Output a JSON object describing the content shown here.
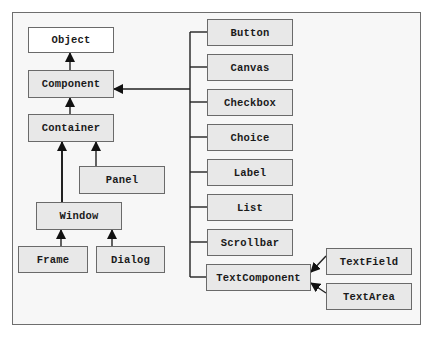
{
  "diagram": {
    "type": "class-hierarchy",
    "colors": {
      "node_fill": "#e8e8e8",
      "root_fill": "#ffffff",
      "border": "#6a6a6a",
      "edge": "#1a1a1a",
      "background": "#f7f7f7"
    },
    "nodes": {
      "object": "Object",
      "component": "Component",
      "container": "Container",
      "panel": "Panel",
      "window": "Window",
      "frame": "Frame",
      "dialog": "Dialog",
      "button": "Button",
      "canvas": "Canvas",
      "checkbox": "Checkbox",
      "choice": "Choice",
      "label": "Label",
      "list": "List",
      "scrollbar": "Scrollbar",
      "textcomponent": "TextComponent",
      "textfield": "TextField",
      "textarea": "TextArea"
    },
    "edges": [
      {
        "from": "Component",
        "to": "Object"
      },
      {
        "from": "Container",
        "to": "Component"
      },
      {
        "from": "Panel",
        "to": "Container"
      },
      {
        "from": "Window",
        "to": "Container"
      },
      {
        "from": "Frame",
        "to": "Window"
      },
      {
        "from": "Dialog",
        "to": "Window"
      },
      {
        "from": "Button",
        "to": "Component"
      },
      {
        "from": "Canvas",
        "to": "Component"
      },
      {
        "from": "Checkbox",
        "to": "Component"
      },
      {
        "from": "Choice",
        "to": "Component"
      },
      {
        "from": "Label",
        "to": "Component"
      },
      {
        "from": "List",
        "to": "Component"
      },
      {
        "from": "Scrollbar",
        "to": "Component"
      },
      {
        "from": "TextComponent",
        "to": "Component"
      },
      {
        "from": "TextField",
        "to": "TextComponent"
      },
      {
        "from": "TextArea",
        "to": "TextComponent"
      }
    ]
  }
}
